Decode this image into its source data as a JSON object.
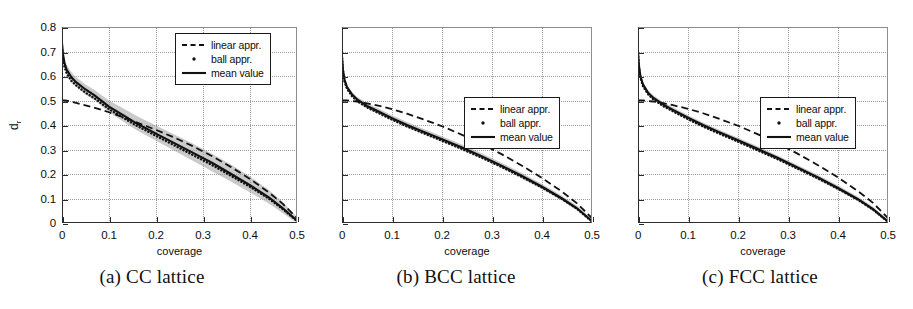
{
  "figure": {
    "panel_count": 3,
    "axis_color": "#2b2b2b",
    "grid_color": "#9a9a9a",
    "band_color": "#9e9e9e",
    "curve_color": "#111111"
  },
  "panels": [
    {
      "id": "a",
      "caption": "(a) CC lattice",
      "show_y_ticklabels": true,
      "legend_position": "top-right",
      "legend": [
        {
          "label": "linear appr.",
          "key": "dashed-line"
        },
        {
          "label": "ball appr.",
          "key": "dot-marker"
        },
        {
          "label": "mean value",
          "key": "solid-line"
        }
      ],
      "chart_data": {
        "type": "line",
        "title": "(a) CC lattice",
        "xlabel": "coverage",
        "ylabel": "d_r",
        "xlim": [
          0,
          0.5
        ],
        "ylim": [
          0,
          0.8
        ],
        "xticks": [
          0,
          0.1,
          0.2,
          0.3,
          0.4,
          0.5
        ],
        "xticklabels": [
          "0",
          "0.1",
          "0.2",
          "0.3",
          "0.4",
          "0.5"
        ],
        "yticks": [
          0,
          0.1,
          0.2,
          0.3,
          0.4,
          0.5,
          0.6,
          0.7,
          0.8
        ],
        "yticklabels": [
          "0",
          "0.1",
          "0.2",
          "0.3",
          "0.4",
          "0.5",
          "0.6",
          "0.7",
          "0.8"
        ],
        "grid": true,
        "legend_position": "upper right",
        "x": [
          0.0,
          0.002,
          0.005,
          0.01,
          0.02,
          0.03,
          0.05,
          0.07,
          0.1,
          0.13,
          0.16,
          0.2,
          0.24,
          0.28,
          0.32,
          0.36,
          0.4,
          0.44,
          0.47,
          0.5
        ],
        "series": [
          {
            "name": "mean value",
            "style": "solid",
            "values": [
              0.735,
              0.69,
              0.655,
              0.625,
              0.595,
              0.575,
              0.545,
              0.52,
              0.475,
              0.44,
              0.405,
              0.365,
              0.325,
              0.285,
              0.245,
              0.2,
              0.155,
              0.105,
              0.06,
              0.01
            ]
          },
          {
            "name": "ball appr.",
            "style": "dotted",
            "values": [
              0.72,
              0.675,
              0.64,
              0.61,
              0.58,
              0.562,
              0.532,
              0.508,
              0.465,
              0.43,
              0.396,
              0.356,
              0.316,
              0.276,
              0.236,
              0.192,
              0.148,
              0.1,
              0.056,
              0.008
            ]
          },
          {
            "name": "linear appr.",
            "style": "dashed",
            "values": [
              0.5,
              0.5,
              0.5,
              0.499,
              0.495,
              0.49,
              0.48,
              0.47,
              0.452,
              0.432,
              0.41,
              0.38,
              0.348,
              0.312,
              0.272,
              0.228,
              0.18,
              0.125,
              0.078,
              0.02
            ]
          }
        ],
        "band": {
          "name": "spread",
          "upper": [
            0.755,
            0.71,
            0.675,
            0.645,
            0.615,
            0.595,
            0.565,
            0.542,
            0.5,
            0.468,
            0.436,
            0.398,
            0.36,
            0.322,
            0.282,
            0.238,
            0.19,
            0.135,
            0.085,
            0.025
          ],
          "lower": [
            0.715,
            0.67,
            0.635,
            0.605,
            0.575,
            0.555,
            0.525,
            0.5,
            0.452,
            0.414,
            0.378,
            0.336,
            0.294,
            0.252,
            0.21,
            0.168,
            0.125,
            0.08,
            0.04,
            0.0
          ]
        }
      }
    },
    {
      "id": "b",
      "caption": "(b) BCC lattice",
      "show_y_ticklabels": false,
      "legend_position": "middle-right",
      "legend": [
        {
          "label": "linear appr.",
          "key": "dashed-line"
        },
        {
          "label": "ball appr.",
          "key": "dot-marker"
        },
        {
          "label": "mean value",
          "key": "solid-line"
        }
      ],
      "chart_data": {
        "type": "line",
        "title": "(b) BCC lattice",
        "xlabel": "coverage",
        "ylabel": "",
        "xlim": [
          0,
          0.5
        ],
        "ylim": [
          0,
          0.8
        ],
        "xticks": [
          0,
          0.1,
          0.2,
          0.3,
          0.4,
          0.5
        ],
        "xticklabels": [
          "0",
          "0.1",
          "0.2",
          "0.3",
          "0.4",
          "0.5"
        ],
        "yticks": [
          0,
          0.1,
          0.2,
          0.3,
          0.4,
          0.5,
          0.6,
          0.7,
          0.8
        ],
        "yticklabels": [],
        "grid": true,
        "legend_position": "center right",
        "x": [
          0.0,
          0.002,
          0.005,
          0.01,
          0.02,
          0.03,
          0.05,
          0.07,
          0.1,
          0.13,
          0.16,
          0.2,
          0.24,
          0.28,
          0.32,
          0.36,
          0.4,
          0.44,
          0.47,
          0.5
        ],
        "series": [
          {
            "name": "mean value",
            "style": "solid",
            "values": [
              0.68,
              0.625,
              0.585,
              0.555,
              0.525,
              0.505,
              0.478,
              0.458,
              0.428,
              0.4,
              0.375,
              0.342,
              0.308,
              0.272,
              0.233,
              0.192,
              0.148,
              0.1,
              0.06,
              0.008
            ]
          },
          {
            "name": "ball appr.",
            "style": "dotted",
            "values": [
              0.672,
              0.618,
              0.578,
              0.548,
              0.518,
              0.498,
              0.472,
              0.452,
              0.422,
              0.394,
              0.369,
              0.336,
              0.302,
              0.266,
              0.228,
              0.188,
              0.145,
              0.098,
              0.058,
              0.006
            ]
          },
          {
            "name": "linear appr.",
            "style": "dashed",
            "values": [
              0.5,
              0.5,
              0.5,
              0.5,
              0.498,
              0.495,
              0.488,
              0.48,
              0.465,
              0.446,
              0.425,
              0.395,
              0.36,
              0.322,
              0.28,
              0.234,
              0.184,
              0.128,
              0.08,
              0.02
            ]
          }
        ],
        "band": {
          "name": "spread",
          "upper": [
            0.69,
            0.635,
            0.595,
            0.565,
            0.535,
            0.515,
            0.49,
            0.47,
            0.44,
            0.412,
            0.387,
            0.354,
            0.32,
            0.284,
            0.245,
            0.204,
            0.159,
            0.111,
            0.07,
            0.016
          ],
          "lower": [
            0.67,
            0.615,
            0.575,
            0.545,
            0.515,
            0.495,
            0.468,
            0.447,
            0.417,
            0.389,
            0.364,
            0.331,
            0.297,
            0.261,
            0.222,
            0.181,
            0.138,
            0.091,
            0.051,
            0.0
          ]
        }
      }
    },
    {
      "id": "c",
      "caption": "(c) FCC lattice",
      "show_y_ticklabels": false,
      "legend_position": "middle-right",
      "legend": [
        {
          "label": "linear appr.",
          "key": "dashed-line"
        },
        {
          "label": "ball appr.",
          "key": "dot-marker"
        },
        {
          "label": "mean value",
          "key": "solid-line"
        }
      ],
      "chart_data": {
        "type": "line",
        "title": "(c) FCC lattice",
        "xlabel": "coverage",
        "ylabel": "",
        "xlim": [
          0,
          0.5
        ],
        "ylim": [
          0,
          0.8
        ],
        "xticks": [
          0,
          0.1,
          0.2,
          0.3,
          0.4,
          0.5
        ],
        "xticklabels": [
          "0",
          "0.1",
          "0.2",
          "0.3",
          "0.4",
          "0.5"
        ],
        "yticks": [
          0,
          0.1,
          0.2,
          0.3,
          0.4,
          0.5,
          0.6,
          0.7,
          0.8
        ],
        "yticklabels": [],
        "grid": true,
        "legend_position": "center right",
        "x": [
          0.0,
          0.002,
          0.005,
          0.01,
          0.02,
          0.03,
          0.05,
          0.07,
          0.1,
          0.13,
          0.16,
          0.2,
          0.24,
          0.28,
          0.32,
          0.36,
          0.4,
          0.44,
          0.47,
          0.5
        ],
        "series": [
          {
            "name": "mean value",
            "style": "solid",
            "values": [
              0.7,
              0.64,
              0.598,
              0.565,
              0.532,
              0.512,
              0.484,
              0.462,
              0.43,
              0.4,
              0.373,
              0.338,
              0.302,
              0.265,
              0.226,
              0.186,
              0.143,
              0.097,
              0.057,
              0.006
            ]
          },
          {
            "name": "ball appr.",
            "style": "dotted",
            "values": [
              0.692,
              0.633,
              0.592,
              0.559,
              0.526,
              0.506,
              0.478,
              0.456,
              0.424,
              0.394,
              0.367,
              0.332,
              0.296,
              0.26,
              0.221,
              0.182,
              0.14,
              0.095,
              0.055,
              0.005
            ]
          },
          {
            "name": "linear appr.",
            "style": "dashed",
            "values": [
              0.5,
              0.5,
              0.5,
              0.5,
              0.498,
              0.496,
              0.489,
              0.481,
              0.466,
              0.448,
              0.427,
              0.397,
              0.362,
              0.324,
              0.282,
              0.236,
              0.186,
              0.13,
              0.082,
              0.02
            ]
          }
        ],
        "band": {
          "name": "spread",
          "upper": [
            0.71,
            0.65,
            0.608,
            0.575,
            0.542,
            0.522,
            0.494,
            0.472,
            0.44,
            0.41,
            0.383,
            0.348,
            0.312,
            0.275,
            0.236,
            0.196,
            0.153,
            0.107,
            0.066,
            0.014
          ],
          "lower": [
            0.69,
            0.63,
            0.588,
            0.555,
            0.522,
            0.502,
            0.474,
            0.452,
            0.42,
            0.39,
            0.363,
            0.328,
            0.292,
            0.255,
            0.216,
            0.176,
            0.133,
            0.088,
            0.048,
            0.0
          ]
        }
      }
    }
  ]
}
